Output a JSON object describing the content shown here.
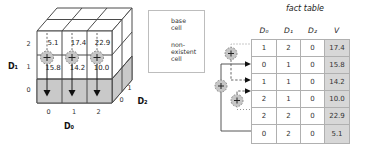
{
  "colors": {
    "nonexistent_gray": "#c9c9c9",
    "value_column_gray": "#d7d7d7",
    "table_border_gray": "#b0b0b0",
    "edge_dark": "#4a4a4a"
  },
  "cube": {
    "top_values": [
      "5.1",
      "17.4",
      "22.9"
    ],
    "mid_values": [
      "15.8",
      "14.2",
      "10.0"
    ],
    "plus_symbol": "+",
    "axes": {
      "d0": {
        "label": "D₀",
        "ticks": [
          "0",
          "1",
          "2"
        ]
      },
      "d1": {
        "label": "D₁",
        "ticks": [
          "2",
          "1",
          "0"
        ]
      },
      "d2": {
        "label": "D₂",
        "ticks": [
          "0",
          "1"
        ]
      }
    }
  },
  "legend": {
    "base": {
      "lines": [
        "base",
        "cell"
      ]
    },
    "nonexistent": {
      "lines": [
        "non-",
        "existent",
        "cell"
      ]
    }
  },
  "fact_table": {
    "title": "fact table",
    "headers": [
      "D₀",
      "D₁",
      "D₂",
      "V"
    ],
    "rows": [
      [
        "1",
        "2",
        "0",
        "17.4"
      ],
      [
        "0",
        "1",
        "0",
        "15.8"
      ],
      [
        "1",
        "1",
        "0",
        "14.2"
      ],
      [
        "2",
        "1",
        "0",
        "10.0"
      ],
      [
        "2",
        "2",
        "0",
        "22.9"
      ],
      [
        "0",
        "2",
        "0",
        "5.1"
      ]
    ]
  }
}
